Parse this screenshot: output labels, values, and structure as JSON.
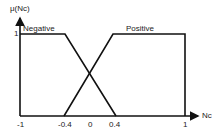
{
  "diagram": {
    "y_axis_label": "μ(Nc)",
    "x_axis_label": "Nc",
    "y_tick": "1",
    "x_ticks": [
      "-1",
      "-0.4",
      "0",
      "0.4",
      "1"
    ],
    "sets": [
      {
        "name": "Negative",
        "points": [
          [
            -1,
            1
          ],
          [
            -0.4,
            1
          ],
          [
            0.4,
            0
          ]
        ]
      },
      {
        "name": "Positive",
        "points": [
          [
            -0.4,
            0
          ],
          [
            0.4,
            1
          ],
          [
            1,
            1
          ]
        ]
      }
    ],
    "line_color": "#111111"
  }
}
